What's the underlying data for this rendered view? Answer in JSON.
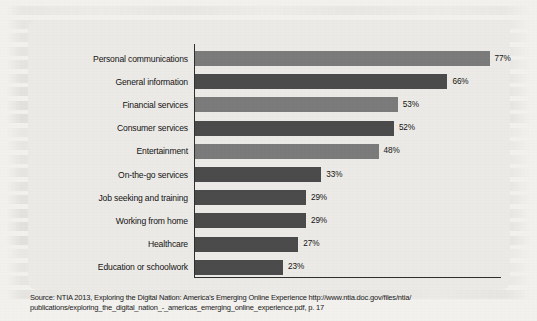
{
  "chart_data": {
    "type": "bar",
    "orientation": "horizontal",
    "title": "",
    "subtitle": "",
    "xlabel": "",
    "ylabel": "",
    "categories": [
      "Personal communications",
      "General information",
      "Financial services",
      "Consumer services",
      "Entertainment",
      "On-the-go services",
      "Job seeking and training",
      "Working from home",
      "Healthcare",
      "Education or schoolwork"
    ],
    "values": [
      77,
      66,
      53,
      52,
      48,
      33,
      29,
      29,
      27,
      23
    ],
    "value_labels": [
      "77%",
      "66%",
      "53%",
      "52%",
      "48%",
      "33%",
      "29%",
      "29%",
      "27%",
      "23%"
    ],
    "bar_tones": [
      "light",
      "dark",
      "light",
      "dark",
      "light",
      "dark",
      "dark",
      "dark",
      "dark",
      "dark"
    ],
    "xlim": [
      0,
      80
    ],
    "unit": "%",
    "grid": false,
    "legend": null,
    "colors": {
      "bar_light": "#7b7b7b",
      "bar_dark": "#4b4b4b",
      "axis": "#2f2f2f",
      "panel_background": "#eceae6",
      "page_background": "#f2f1ee",
      "text": "#141414"
    }
  },
  "source": {
    "line1": "Source: NTIA 2013, Exploring the Digital Nation: America's Emerging Online Experience http://www.ntia.doc.gov/files/ntia/",
    "line2": "publications/exploring_the_digital_nation_-_americas_emerging_online_experience.pdf, p. 17"
  }
}
